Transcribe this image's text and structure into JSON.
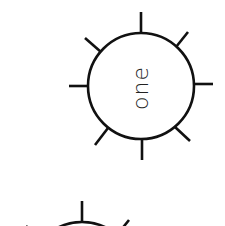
{
  "diagram": {
    "background": "#ffffff",
    "stroke_color": "#111111",
    "nodes": [
      {
        "label": "one",
        "label_rotation_deg": -90,
        "shape": "circle-with-radial-spikes",
        "center": [
          141,
          86
        ],
        "radius": 53,
        "spike_count": 8,
        "spike_length": 20,
        "visible": "full"
      },
      {
        "label": "",
        "shape": "circle-with-radial-spikes",
        "center": [
          82,
          275
        ],
        "radius": 53,
        "spike_count": 8,
        "spike_length": 20,
        "visible": "partial-top-only"
      }
    ]
  }
}
